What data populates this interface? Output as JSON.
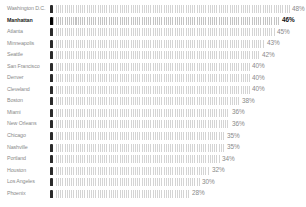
{
  "chart_data": {
    "type": "bar",
    "orientation": "horizontal",
    "style": "pictogram (repeated person silhouettes, first figure dark)",
    "title": "",
    "xlabel": "",
    "ylabel": "",
    "unit": "%",
    "highlight": "Manhattan",
    "xlim": [
      0,
      48
    ],
    "grid": false,
    "legend": null,
    "categories": [
      "Washington D.C.",
      "Manhattan",
      "Atlanta",
      "Minneapolis",
      "Seattle",
      "San Francisco",
      "Denver",
      "Cleveland",
      "Boston",
      "Miami",
      "New Orleans",
      "Chicago",
      "Nashville",
      "Portland",
      "Houston",
      "Los Angeles",
      "Phoenix"
    ],
    "values": [
      48,
      46,
      45,
      43,
      42,
      40,
      40,
      40,
      38,
      36,
      36,
      35,
      35,
      34,
      32,
      30,
      28
    ],
    "value_labels": [
      "48%",
      "46%",
      "45%",
      "43%",
      "42%",
      "40%",
      "40%",
      "40%",
      "38%",
      "36%",
      "36%",
      "35%",
      "35%",
      "34%",
      "32%",
      "30%",
      "28%"
    ]
  },
  "colors": {
    "label": "#8a8a8a",
    "highlight_label": "#111111",
    "figure_light": "#cfcfcf",
    "figure_dark": "#2a2a2a"
  }
}
